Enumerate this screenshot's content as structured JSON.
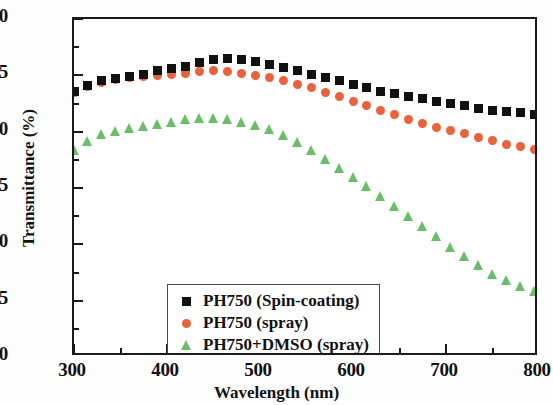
{
  "chart_data": {
    "type": "scatter",
    "title": "",
    "xlabel": "Wavelength (nm)",
    "ylabel": "Transmittance (%)",
    "xlim": [
      300,
      800
    ],
    "ylim": [
      70,
      100
    ],
    "xticks": [
      300,
      400,
      500,
      600,
      700,
      800
    ],
    "xticks_minor": [
      350,
      450,
      550,
      650,
      750
    ],
    "yticks": [
      70,
      75,
      80,
      85,
      90,
      95,
      100
    ],
    "yticks_minor": [
      72.5,
      77.5,
      82.5,
      87.5,
      92.5,
      97.5
    ],
    "grid": false,
    "legend_position": "lower left",
    "series": [
      {
        "name": "PH750 (Spin-coating)",
        "color": "#111111",
        "marker": "square",
        "x": [
          300,
          315,
          330,
          345,
          360,
          375,
          390,
          405,
          420,
          435,
          450,
          465,
          480,
          495,
          510,
          525,
          540,
          555,
          570,
          585,
          600,
          615,
          630,
          645,
          660,
          675,
          690,
          705,
          720,
          735,
          750,
          765,
          780,
          795
        ],
        "y": [
          93.6,
          94.1,
          94.5,
          94.7,
          94.9,
          95.1,
          95.4,
          95.6,
          95.8,
          96.1,
          96.4,
          96.5,
          96.4,
          96.2,
          96.0,
          95.7,
          95.4,
          95.1,
          94.8,
          94.5,
          94.2,
          93.9,
          93.6,
          93.4,
          93.1,
          92.9,
          92.7,
          92.5,
          92.3,
          92.1,
          91.9,
          91.8,
          91.7,
          91.5
        ]
      },
      {
        "name": "PH750 (spray)",
        "color": "#E8623C",
        "marker": "circle",
        "x": [
          300,
          315,
          330,
          345,
          360,
          375,
          390,
          405,
          420,
          435,
          450,
          465,
          480,
          495,
          510,
          525,
          540,
          555,
          570,
          585,
          600,
          615,
          630,
          645,
          660,
          675,
          690,
          705,
          720,
          735,
          750,
          765,
          780,
          795
        ],
        "y": [
          93.5,
          94.0,
          94.4,
          94.6,
          94.8,
          94.9,
          95.0,
          95.1,
          95.2,
          95.3,
          95.4,
          95.3,
          95.2,
          95.0,
          94.8,
          94.5,
          94.2,
          93.9,
          93.5,
          93.1,
          92.7,
          92.3,
          91.9,
          91.5,
          91.1,
          90.7,
          90.4,
          90.1,
          89.8,
          89.5,
          89.2,
          88.9,
          88.7,
          88.4
        ]
      },
      {
        "name": "PH750+DMSO (spray)",
        "color": "#6ABE6A",
        "marker": "triangle",
        "x": [
          300,
          315,
          330,
          345,
          360,
          375,
          390,
          405,
          420,
          435,
          450,
          465,
          480,
          495,
          510,
          525,
          540,
          555,
          570,
          585,
          600,
          615,
          630,
          645,
          660,
          675,
          690,
          705,
          720,
          735,
          750,
          765,
          780,
          795
        ],
        "y": [
          88.4,
          89.2,
          89.8,
          90.1,
          90.3,
          90.5,
          90.7,
          90.9,
          91.1,
          91.2,
          91.2,
          91.1,
          90.9,
          90.6,
          90.2,
          89.7,
          89.1,
          88.4,
          87.6,
          86.8,
          86.0,
          85.2,
          84.3,
          83.4,
          82.5,
          81.6,
          80.7,
          79.8,
          79.0,
          78.2,
          77.4,
          76.8,
          76.3,
          75.9
        ]
      }
    ]
  }
}
